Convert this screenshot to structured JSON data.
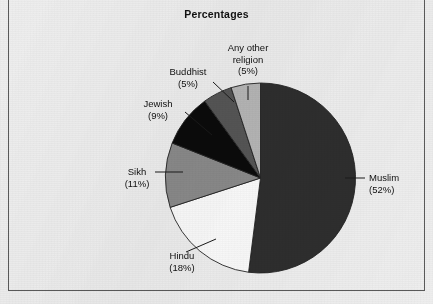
{
  "figure": {
    "title": "Percentages",
    "frame_color": "#5a5a5a",
    "background_color": "#eeeeee"
  },
  "chart_data": {
    "type": "pie",
    "title": "Percentages",
    "xlabel": "",
    "ylabel": "",
    "legend_position": "none",
    "grid": false,
    "start_angle_deg": 0,
    "direction": "clockwise",
    "units": "%",
    "categories": [
      "Muslim",
      "Hindu",
      "Sikh",
      "Jewish",
      "Buddhist",
      "Any other religion"
    ],
    "values": [
      52,
      18,
      11,
      9,
      5,
      5
    ],
    "colors": [
      "#2e2e2e",
      "#fbfbfb",
      "#8a8a8a",
      "#0b0b0b",
      "#565656",
      "#b6b6b6"
    ],
    "slices": [
      {
        "label": "Muslim",
        "value": 52,
        "value_text": "(52%)",
        "color": "#2e2e2e"
      },
      {
        "label": "Hindu",
        "value": 18,
        "value_text": "(18%)",
        "color": "#fbfbfb"
      },
      {
        "label": "Sikh",
        "value": 11,
        "value_text": "(11%)",
        "color": "#8a8a8a"
      },
      {
        "label": "Jewish",
        "value": 9,
        "value_text": "(9%)",
        "color": "#0b0b0b"
      },
      {
        "label": "Buddhist",
        "value": 5,
        "value_text": "(5%)",
        "color": "#565656"
      },
      {
        "label": "Any other religion",
        "value": 5,
        "value_text": "(5%)",
        "color": "#b6b6b6"
      }
    ]
  },
  "labels": {
    "muslim": {
      "name": "Muslim",
      "pct": "(52%)"
    },
    "hindu": {
      "name": "Hindu",
      "pct": "(18%)"
    },
    "sikh": {
      "name": "Sikh",
      "pct": "(11%)"
    },
    "jewish": {
      "name": "Jewish",
      "pct": "(9%)"
    },
    "buddhist": {
      "name": "Buddhist",
      "pct": "(5%)"
    },
    "other": {
      "name_line1": "Any other",
      "name_line2": "religion",
      "pct": "(5%)"
    }
  }
}
